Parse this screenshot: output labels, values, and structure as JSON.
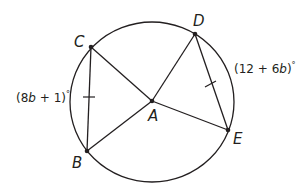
{
  "diagram": {
    "type": "circle-with-central-angles",
    "center": {
      "label": "A",
      "x": 152,
      "y": 101
    },
    "circle": {
      "cx": 152,
      "cy": 102,
      "rx": 82,
      "ry": 80
    },
    "points": [
      {
        "label": "C",
        "x": 91,
        "y": 47
      },
      {
        "label": "D",
        "x": 195,
        "y": 34
      },
      {
        "label": "E",
        "x": 228,
        "y": 130
      },
      {
        "label": "B",
        "x": 87,
        "y": 151
      }
    ],
    "arc_labels": {
      "left": {
        "prefix": "(8",
        "var": "b",
        "suffix": " + 1)",
        "degree": "°"
      },
      "right": {
        "prefix": "(12 + 6",
        "var": "b",
        "suffix": ")",
        "degree": "°"
      }
    },
    "congruent_chords": [
      "CB",
      "DE"
    ],
    "colors": {
      "stroke": "#231f20",
      "background": "#ffffff"
    }
  }
}
